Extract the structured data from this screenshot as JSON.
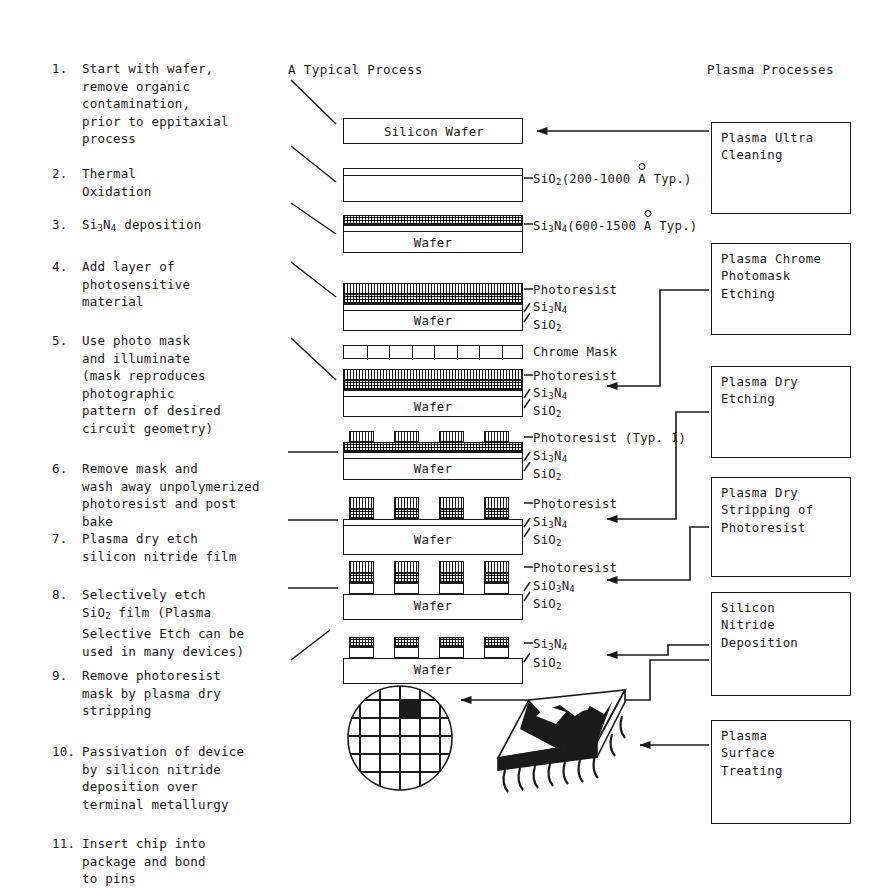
{
  "headings": {
    "center": "A Typical Process",
    "right": "Plasma Processes"
  },
  "steps": [
    {
      "num": "1.",
      "text": "Start with wafer,\nremove organic\ncontamination,\nprior to eppitaxial\nprocess"
    },
    {
      "num": "2.",
      "text": "Thermal\nOxidation"
    },
    {
      "num": "3.",
      "text": "Si3N4 deposition"
    },
    {
      "num": "4.",
      "text": "Add layer of\nphotosensitive\nmaterial"
    },
    {
      "num": "5.",
      "text": "Use photo mask\nand illuminate\n(mask reproduces\nphotographic\npattern of desired\ncircuit geometry)"
    },
    {
      "num": "6.",
      "text": "Remove mask and\nwash away unpolymerized\nphotoresist and post\nbake"
    },
    {
      "num": "7.",
      "text": "Plasma dry etch\nsilicon nitride film"
    },
    {
      "num": "8.",
      "text": "Selectively etch\nSiO2 film (Plasma\nSelective Etch can be\nused in many devices)"
    },
    {
      "num": "9.",
      "text": "Remove photoresist\nmask by plasma dry\nstripping"
    },
    {
      "num": "10.",
      "text": "Passivation of device\nby silicon nitride\ndeposition over\nterminal metallurgy"
    },
    {
      "num": "11.",
      "text": "Insert chip into\npackage and bond\nto pins"
    }
  ],
  "plasma_boxes": [
    {
      "id": "ultra-cleaning",
      "text": "Plasma Ultra\nCleaning"
    },
    {
      "id": "chrome-photomask",
      "text": "Plasma Chrome\nPhotomask\nEtching"
    },
    {
      "id": "dry-etching",
      "text": "Plasma Dry\nEtching"
    },
    {
      "id": "dry-stripping",
      "text": "Plasma Dry\nStripping of\nPhotoresist"
    },
    {
      "id": "nitride-deposition",
      "text": "Silicon\nNitride\nDeposition"
    },
    {
      "id": "surface-treating",
      "text": "Plasma\nSurface\nTreating"
    }
  ],
  "diagram_labels": {
    "silicon_wafer": "Silicon Wafer",
    "wafer": "Wafer",
    "chrome_mask": "Chrome Mask",
    "photoresist": "Photoresist",
    "photoresist_typ": "Photoresist (Typ. 1)",
    "sio2": "SiO2",
    "si3n4": "Si3N4",
    "sio3n4": "SiO3N4",
    "sio2_thickness_pre": "SiO",
    "sio2_thickness": "(200-1000",
    "si3n4_thickness": "(600-1500",
    "angstrom": "A",
    "typ_suffix": "Typ.)"
  },
  "colors": {
    "ink": "#1a1a1a",
    "paper": "#ffffff"
  }
}
